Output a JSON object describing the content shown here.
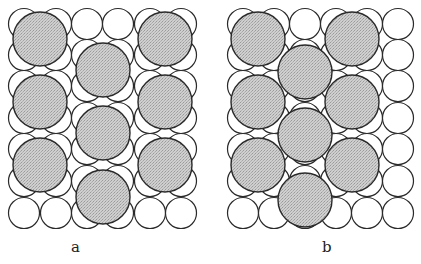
{
  "figure": {
    "width": 421,
    "height": 264,
    "colors": {
      "background": "#ffffff",
      "stroke": "#2a2a2a",
      "small_fill": "#ffffff",
      "large_fill": "#c9c9c9"
    },
    "small_radius": 15.5,
    "large_radius": 27,
    "rows_y": [
      24,
      55,
      86,
      118,
      149,
      181,
      213
    ]
  },
  "panels": [
    {
      "id": "a",
      "label": "a",
      "label_pos": [
        71,
        240
      ],
      "columns_x": [
        24,
        56,
        87,
        118,
        150,
        181
      ],
      "large_circles": [
        [
          40,
          39
        ],
        [
          40,
          102
        ],
        [
          40,
          165
        ],
        [
          103,
          70
        ],
        [
          103,
          133
        ],
        [
          103,
          197
        ],
        [
          165,
          39
        ],
        [
          165,
          102
        ],
        [
          165,
          165
        ]
      ]
    },
    {
      "id": "b",
      "label": "b",
      "label_pos": [
        322,
        240
      ],
      "columns_x": [
        243,
        274,
        305,
        336,
        367,
        398
      ],
      "large_circles": [
        [
          258,
          39
        ],
        [
          258,
          102
        ],
        [
          258,
          165
        ],
        [
          305,
          72
        ],
        [
          305,
          135
        ],
        [
          305,
          200
        ],
        [
          352,
          39
        ],
        [
          352,
          102
        ],
        [
          352,
          165
        ]
      ]
    }
  ]
}
